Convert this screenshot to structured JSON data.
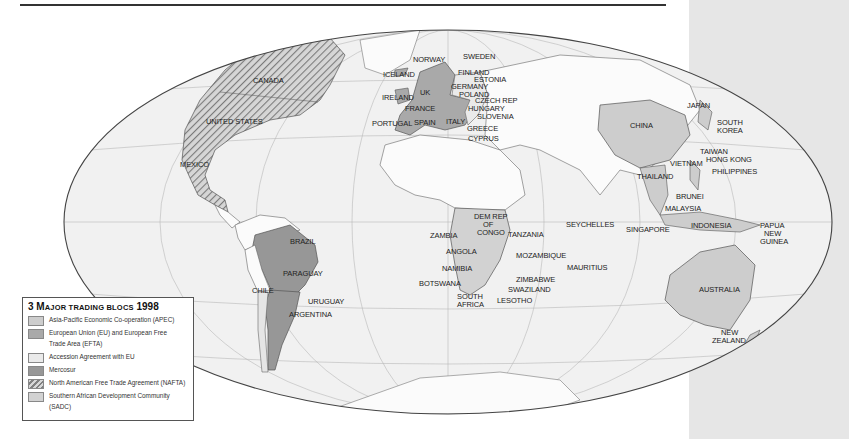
{
  "map": {
    "title_number": "3",
    "title": "Major trading blocs 1998",
    "colors": {
      "ocean": "#f1f1f1",
      "land": "#fbfbfb",
      "apec": "#cdcdcd",
      "eu_efta": "#a9a9a9",
      "accession": "#eaeaea",
      "mercosur": "#979797",
      "nafta_hatch": "#8c8c8c",
      "sadc": "#d2d2d2",
      "side_panel": "#e6e6e6",
      "outline": "#444444"
    },
    "labels": {
      "canada": "CANADA",
      "united_states": "UNITED STATES",
      "mexico": "MEXICO",
      "brazil": "BRAZIL",
      "paraguay": "PARAGUAY",
      "chile": "CHILE",
      "uruguay": "URUGUAY",
      "argentina": "ARGENTINA",
      "iceland": "ICELAND",
      "norway": "NORWAY",
      "sweden": "SWEDEN",
      "finland": "FINLAND",
      "estonia": "ESTONIA",
      "germany": "GERMANY",
      "poland": "POLAND",
      "uk": "UK",
      "ireland": "IRELAND",
      "france": "FRANCE",
      "czech_rep": "CZECH REP",
      "hungary": "HUNGARY",
      "slovenia": "SLOVENIA",
      "portugal": "PORTUGAL",
      "spain": "SPAIN",
      "italy": "ITALY",
      "greece": "GREECE",
      "cyprus": "CYPRUS",
      "dem_rep_congo_1": "DEM REP",
      "dem_rep_congo_2": "OF",
      "dem_rep_congo_3": "CONGO",
      "zambia": "ZAMBIA",
      "tanzania": "TANZANIA",
      "angola": "ANGOLA",
      "mozambique": "MOZAMBIQUE",
      "namibia": "NAMIBIA",
      "botswana": "BOTSWANA",
      "zimbabwe": "ZIMBABWE",
      "swaziland": "SWAZILAND",
      "south_africa_1": "SOUTH",
      "south_africa_2": "AFRICA",
      "lesotho": "LESOTHO",
      "seychelles": "SEYCHELLES",
      "mauritius": "MAURITIUS",
      "singapore": "SINGAPORE",
      "china": "CHINA",
      "japan": "JAPAN",
      "south_korea_1": "SOUTH",
      "south_korea_2": "KOREA",
      "taiwan": "TAIWAN",
      "hong_kong": "HONG KONG",
      "philippines": "PHILIPPINES",
      "vietnam": "VIETNAM",
      "thailand": "THAILAND",
      "brunei": "BRUNEI",
      "malaysia": "MALAYSIA",
      "indonesia": "INDONESIA",
      "papua_1": "PAPUA",
      "papua_2": "NEW",
      "papua_3": "GUINEA",
      "australia": "AUSTRALIA",
      "new_zealand_1": "NEW",
      "new_zealand_2": "ZEALAND"
    }
  },
  "legend": {
    "title_number": "3",
    "title_first": "M",
    "title_rest": "AJOR TRADING BLOCS",
    "year": "1998",
    "items": [
      {
        "label": "Asia-Pacific Economic Co-operation (APEC)",
        "color": "#cdcdcd"
      },
      {
        "label": "European Union (EU) and European Free",
        "label2": "Trade Area (EFTA)",
        "color": "#a9a9a9"
      },
      {
        "label": "Accession Agreement with EU",
        "color": "#eaeaea"
      },
      {
        "label": "Mercosur",
        "color": "#979797"
      },
      {
        "label": "North American Free Trade Agreement (NAFTA)",
        "color": "hatch"
      },
      {
        "label": "Southern African Development Community (SADC)",
        "color": "#d2d2d2"
      }
    ]
  }
}
